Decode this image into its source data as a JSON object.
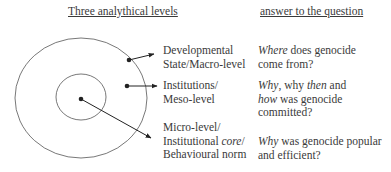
{
  "headers": {
    "levels": "Three analythical levels",
    "answers": "answer to the question"
  },
  "levels": [
    {
      "name": "macro",
      "label_lines": [
        "Developmental",
        "State/Macro-level"
      ],
      "answer_lines": [
        [
          {
            "t": "Where",
            "i": true
          },
          {
            "t": " does genocide",
            "i": false
          }
        ],
        [
          {
            "t": "come from?",
            "i": false
          }
        ]
      ]
    },
    {
      "name": "meso",
      "label_lines": [
        "Institutions/",
        "Meso-level"
      ],
      "answer_lines": [
        [
          {
            "t": "Why",
            "i": true
          },
          {
            "t": ", why ",
            "i": false
          },
          {
            "t": "then",
            "i": true
          },
          {
            "t": " and",
            "i": false
          }
        ],
        [
          {
            "t": "how",
            "i": true
          },
          {
            "t": " was genocide",
            "i": false
          }
        ],
        [
          {
            "t": "committed?",
            "i": false
          }
        ]
      ]
    },
    {
      "name": "micro",
      "label_lines": [
        "Micro-level/",
        "Institutional core/",
        "Behavioural norm"
      ],
      "label_italic": "core",
      "answer_lines": [
        [
          {
            "t": "Why",
            "i": true
          },
          {
            "t": " was genocide popular",
            "i": false
          }
        ],
        [
          {
            "t": "and efficient?",
            "i": false
          }
        ]
      ]
    }
  ],
  "colors": {
    "stroke": "#555555",
    "text": "#3a3a3a",
    "dot": "#222222"
  }
}
